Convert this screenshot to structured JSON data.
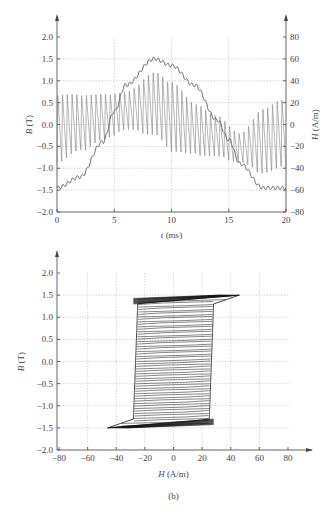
{
  "chart_data": [
    {
      "id": "a",
      "type": "line",
      "title": "",
      "xlabel": "t (ms)",
      "ylabel": "B (T)",
      "y2label": "H (A/m)",
      "xlim": [
        0,
        20
      ],
      "ylim": [
        -2.0,
        2.0
      ],
      "y2lim": [
        -80,
        80
      ],
      "x_ticks": [
        "0",
        "5",
        "10",
        "15",
        "20"
      ],
      "y_ticks": [
        "2.0",
        "1.5",
        "1.0",
        "0.5",
        "0.0",
        "-0.5",
        "-1.0",
        "-1.5",
        "-2.0"
      ],
      "y2_ticks": [
        "80",
        "60",
        "40",
        "20",
        "0",
        "-20",
        "-40",
        "-60",
        "-80"
      ],
      "grid": true,
      "series": [
        {
          "name": "B",
          "axis": "left",
          "description": "sinusoid with ripple, ~-1.45 T at t=0, peak ~1.5 T at t~8.5 ms, ~-1.45 T at t=20 ms",
          "x": [
            0,
            2,
            4,
            5,
            6,
            8.5,
            10,
            12,
            14,
            15,
            16,
            18,
            20
          ],
          "y": [
            -1.45,
            -1.2,
            -0.4,
            0.3,
            0.9,
            1.5,
            1.35,
            0.9,
            0.1,
            -0.35,
            -0.9,
            -1.45,
            -1.45
          ]
        },
        {
          "name": "H",
          "axis": "right",
          "description": "high-frequency oscillating field, envelope upper ~28 A/m then rises to ~48 at t~8.5 ms, lower envelope ~-35 then ~-30; shifts negative after 15 ms",
          "x": [
            0,
            2,
            4,
            6,
            8.5,
            10,
            12,
            14,
            16,
            18,
            20
          ],
          "upper": [
            28,
            28,
            28,
            30,
            48,
            40,
            20,
            8,
            -8,
            15,
            25
          ],
          "lower": [
            -35,
            -25,
            -15,
            -5,
            -10,
            -25,
            -28,
            -30,
            -35,
            -45,
            -40
          ]
        }
      ]
    },
    {
      "id": "b",
      "type": "line",
      "title": "",
      "caption": "(b)",
      "xlabel": "H (A/m)",
      "ylabel": "B (T)",
      "xlim": [
        -80,
        80
      ],
      "ylim": [
        -2.0,
        2.0
      ],
      "x_ticks": [
        "-80",
        "-60",
        "-40",
        "-20",
        "0",
        "20",
        "40",
        "60",
        "80"
      ],
      "y_ticks": [
        "2.0",
        "1.5",
        "1.0",
        "0.5",
        "0.0",
        "-0.5",
        "-1.0",
        "-1.5",
        "-2.0"
      ],
      "grid": true,
      "series": [
        {
          "name": "B-H hysteresis loop",
          "description": "major loop with minor loops; tips at (46,1.5) and (-46,-1.5); coercive ~±28 A/m",
          "x": [
            -46,
            -28,
            -28,
            -25,
            28,
            30,
            46,
            28,
            28,
            25,
            -28,
            -30,
            -46
          ],
          "y": [
            -1.5,
            -1.3,
            0.0,
            1.3,
            1.3,
            1.4,
            1.5,
            1.3,
            0.0,
            -1.3,
            -1.3,
            -1.4,
            -1.5
          ]
        }
      ]
    }
  ]
}
